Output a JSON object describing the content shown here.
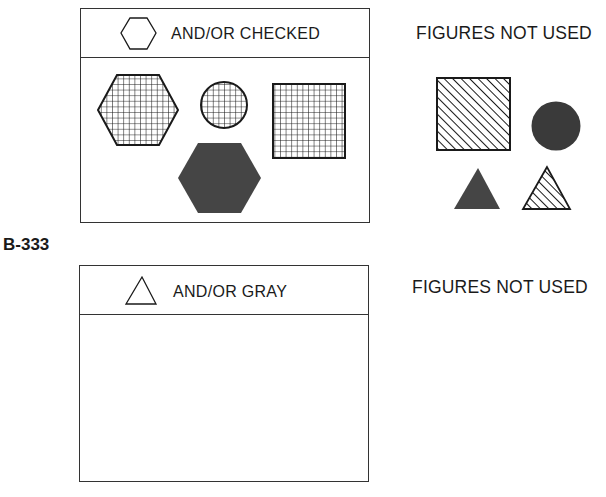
{
  "sections": [
    {
      "header": {
        "icon": "hexagon-outline-icon",
        "text": "AND/OR CHECKED"
      },
      "figures": [
        {
          "shape": "hexagon",
          "fill": "checked"
        },
        {
          "shape": "circle",
          "fill": "checked"
        },
        {
          "shape": "square",
          "fill": "checked"
        },
        {
          "shape": "hexagon",
          "fill": "gray"
        }
      ],
      "side_label": "FIGURES NOT USED",
      "unused_figures": [
        {
          "shape": "square",
          "fill": "striped"
        },
        {
          "shape": "circle",
          "fill": "gray"
        },
        {
          "shape": "triangle",
          "fill": "gray"
        },
        {
          "shape": "triangle",
          "fill": "striped"
        }
      ]
    },
    {
      "item_label": "B-333",
      "header": {
        "icon": "triangle-outline-icon",
        "text": "AND/OR GRAY"
      },
      "figures": [],
      "side_label": "FIGURES NOT USED",
      "unused_figures": []
    }
  ],
  "colors": {
    "stroke": "#1a1a1a",
    "gray_fill": "#454545",
    "border": "#333333"
  }
}
